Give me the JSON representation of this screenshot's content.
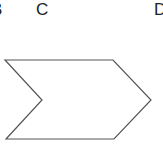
{
  "labels": [
    {
      "text": "B",
      "x": -9
    },
    {
      "text": "C",
      "x": 36
    },
    {
      "text": "D",
      "x": 154
    }
  ],
  "shape": {
    "type": "chevron",
    "stroke": "#555555",
    "fill": "#ffffff",
    "points": "5,60 113,60 151,100 114,139 6,139 42,100"
  }
}
